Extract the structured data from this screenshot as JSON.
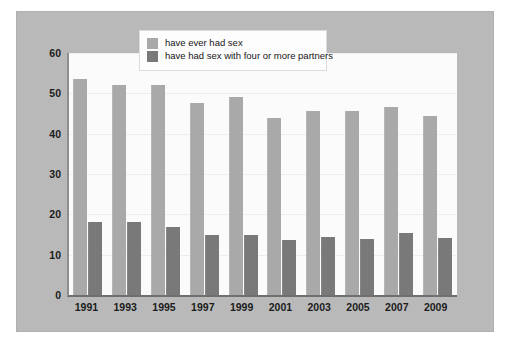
{
  "chart_data": {
    "type": "bar",
    "title": "",
    "xlabel": "",
    "ylabel": "",
    "ylim": [
      0,
      60
    ],
    "yticks": [
      0,
      10,
      20,
      30,
      40,
      50,
      60
    ],
    "grid": true,
    "legend_position": "top-center",
    "categories": [
      "1991",
      "1993",
      "1995",
      "1997",
      "1999",
      "2001",
      "2003",
      "2005",
      "2007",
      "2009"
    ],
    "series": [
      {
        "name": "have ever had sex",
        "color": "#a9a9a9",
        "values": [
          53.5,
          52.0,
          52.0,
          47.5,
          49.0,
          44.0,
          45.5,
          45.5,
          46.5,
          44.5
        ]
      },
      {
        "name": "have had sex with four or more partners",
        "color": "#797979",
        "values": [
          18.2,
          18.2,
          16.8,
          14.8,
          14.8,
          13.7,
          14.4,
          13.9,
          15.3,
          14.2
        ]
      }
    ]
  },
  "legend": {
    "items": [
      {
        "label": "have ever had sex",
        "swatch": "light"
      },
      {
        "label": "have had sex with four or more partners",
        "swatch": "dark"
      }
    ]
  },
  "colors": {
    "background": "#ffffff",
    "frame": "#b9b9b9",
    "plot_background": "#fbfbfb",
    "gridline": "#ededed",
    "axis": "#6f6f6f",
    "series_light": "#a9a9a9",
    "series_dark": "#797979",
    "text": "#1c1c1c"
  }
}
